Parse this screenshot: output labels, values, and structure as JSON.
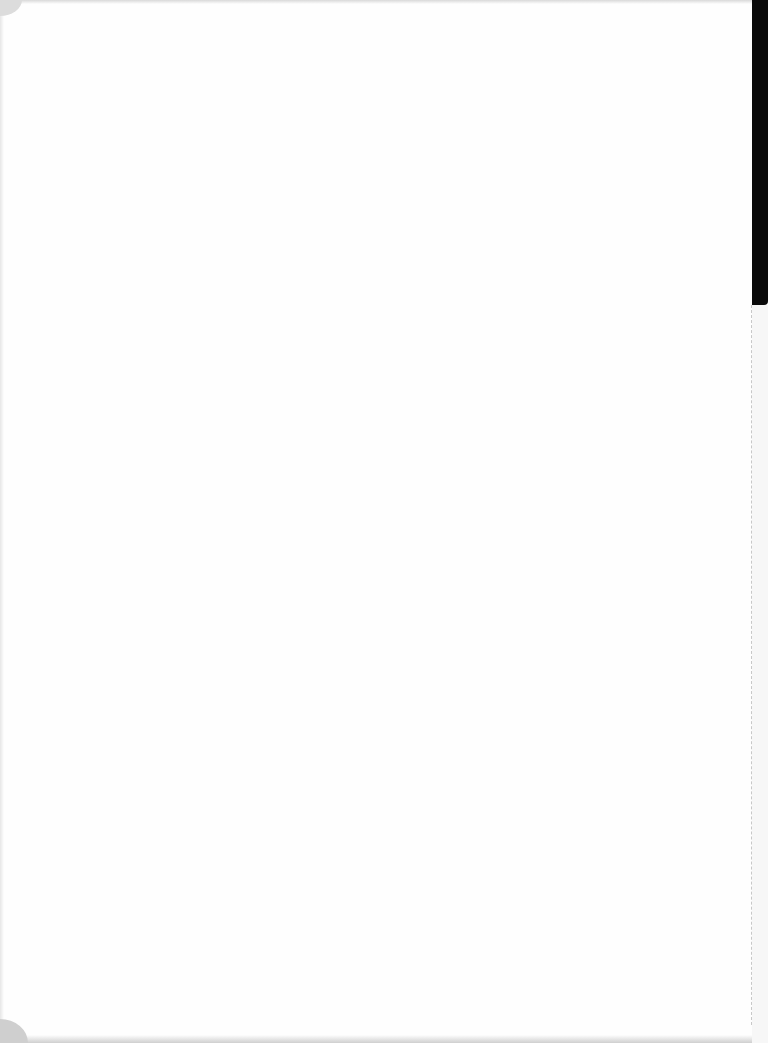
{
  "document": {
    "type": "scanned-page",
    "content": "",
    "colors": {
      "paper": "#fefefe",
      "binding": "#0a0a0a",
      "edge_shadow": "#cfcfcf"
    }
  }
}
